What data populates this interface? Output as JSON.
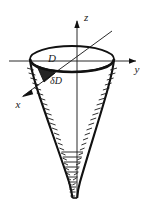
{
  "figure": {
    "background_color": "#ffffff",
    "ink_color": "#111111",
    "axis_color": "#2b2b2b",
    "width": 154,
    "height": 205,
    "axes": [
      {
        "name": "z-axis",
        "label": "z",
        "direction": "up",
        "label_x": 80,
        "label_y": 17
      },
      {
        "name": "y-axis",
        "label": "y",
        "direction": "right",
        "label_x": 138,
        "label_y": 72
      },
      {
        "name": "x-axis",
        "label": "x",
        "direction": "down-left",
        "label_x": 16,
        "label_y": 105
      }
    ],
    "regions": [
      {
        "name": "disk-D",
        "label": "D",
        "label_x": 52,
        "label_y": 58
      },
      {
        "name": "element-delta-D",
        "label": "δD",
        "label_x": 56,
        "label_y": 80
      }
    ],
    "origin": {
      "x": 77,
      "y": 61
    },
    "opening": {
      "name": "elliptical-rim",
      "center_x": 72,
      "center_y": 59,
      "radius_x": 42,
      "radius_y": 13
    },
    "surface": {
      "name": "horn-funnel",
      "top_y": 59,
      "bottom_y": 198,
      "neck_half_width": 3,
      "hatch_marks": 34
    }
  }
}
